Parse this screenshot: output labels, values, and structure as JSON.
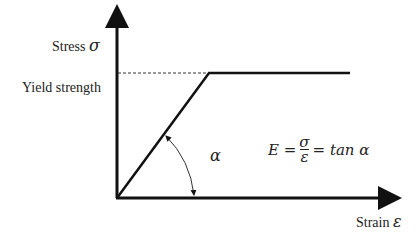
{
  "diagram": {
    "type": "stress-strain (elastic-perfectly plastic)",
    "y_axis": {
      "label": "Stress",
      "symbol": "σ"
    },
    "x_axis": {
      "label": "Strain",
      "symbol": "ε"
    },
    "yield_label": "Yield strength",
    "angle_symbol": "α",
    "formula": {
      "lhs": "E =",
      "numerator": "σ",
      "denominator": "ε",
      "rhs": "= tan α"
    },
    "colors": {
      "line": "#111111",
      "dashed": "#333333",
      "text": "#222222"
    }
  }
}
